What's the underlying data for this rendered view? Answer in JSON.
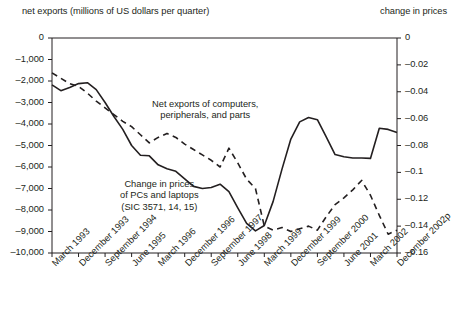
{
  "header": {
    "left_title": "net exports (millions of US dollars per quarter)",
    "right_title": "change in prices"
  },
  "annotations": {
    "net_exports": {
      "line1": "Net exports of computers,",
      "line2": "peripherals, and parts"
    },
    "prices": {
      "line1": "Change in prices",
      "line2": "of PCs and laptops",
      "line3": "(SIC 3571, 14, 15)"
    }
  },
  "chart_data": {
    "type": "line",
    "title": "",
    "xlabel": "",
    "ylabel": "net exports (millions of US dollars per quarter)",
    "y2label": "change in prices",
    "grid": false,
    "legend": "annotations-inline",
    "ylim": [
      -10000,
      0
    ],
    "y2lim": [
      -0.16,
      0
    ],
    "y_ticks": [
      0,
      -1000,
      -2000,
      -3000,
      -4000,
      -5000,
      -6000,
      -7000,
      -8000,
      -9000,
      -10000
    ],
    "y_tick_labels": [
      "0",
      "–1,000",
      "–2,000",
      "–3,000",
      "–4,000",
      "–5,000",
      "–6,000",
      "–7,000",
      "–8,000",
      "–9,000",
      "–10,000"
    ],
    "y2_ticks": [
      0,
      -0.02,
      -0.04,
      -0.06,
      -0.08,
      -0.1,
      -0.12,
      -0.14,
      -0.16
    ],
    "y2_tick_labels": [
      "0",
      "–0.02",
      "–0.04",
      "–0.06",
      "–0.08",
      "–0.1",
      "–0.12",
      "–0.14",
      "–0.16"
    ],
    "x_tick_labels": [
      "March 1993",
      "December 1993",
      "September 1994",
      "June 1995",
      "March 1996",
      "December 1996",
      "September 1997",
      "June 1998",
      "March 1999",
      "December 1999",
      "September 2000",
      "June 2001",
      "March 2002",
      "December 2002p"
    ],
    "x_quarters": [
      "March 1993",
      "June 1993",
      "September 1993",
      "December 1993",
      "March 1994",
      "June 1994",
      "September 1994",
      "December 1994",
      "March 1995",
      "June 1995",
      "September 1995",
      "December 1995",
      "March 1996",
      "June 1996",
      "September 1996",
      "December 1996",
      "March 1997",
      "June 1997",
      "September 1997",
      "December 1997",
      "March 1998",
      "June 1998",
      "September 1998",
      "December 1998",
      "March 1999",
      "June 1999",
      "September 1999",
      "December 1999",
      "March 2000",
      "June 2000",
      "September 2000",
      "December 2000",
      "March 2001",
      "June 2001",
      "September 2001",
      "December 2001",
      "March 2002",
      "June 2002",
      "September 2002",
      "December 2002p"
    ],
    "series": [
      {
        "name": "Net exports of computers, peripherals, and parts",
        "axis": "left",
        "style": "solid",
        "color": "#231f20",
        "units": "millions of US dollars per quarter",
        "values": [
          -2180,
          -2450,
          -2300,
          -2120,
          -2080,
          -2400,
          -3000,
          -3650,
          -4250,
          -5000,
          -5450,
          -5480,
          -5900,
          -6080,
          -6200,
          -6550,
          -6900,
          -7000,
          -6950,
          -6800,
          -7150,
          -7900,
          -8620,
          -8970,
          -8720,
          -7600,
          -6100,
          -4700,
          -3900,
          -3700,
          -3800,
          -4600,
          -5420,
          -5520,
          -5580,
          -5580,
          -5600,
          -4200,
          -4250,
          -4400
        ]
      },
      {
        "name": "Change in prices of PCs and laptops (SIC 3571, 14, 15)",
        "axis": "right",
        "style": "dashed",
        "color": "#231f20",
        "units": "change in prices",
        "values": [
          -0.026,
          -0.03,
          -0.034,
          -0.036,
          -0.041,
          -0.047,
          -0.052,
          -0.057,
          -0.062,
          -0.066,
          -0.072,
          -0.078,
          -0.074,
          -0.071,
          -0.074,
          -0.079,
          -0.083,
          -0.087,
          -0.091,
          -0.096,
          -0.082,
          -0.093,
          -0.105,
          -0.112,
          -0.14,
          -0.143,
          -0.141,
          -0.144,
          -0.142,
          -0.14,
          -0.143,
          -0.133,
          -0.124,
          -0.119,
          -0.113,
          -0.106,
          -0.117,
          -0.132,
          -0.146,
          -0.143
        ]
      }
    ]
  }
}
